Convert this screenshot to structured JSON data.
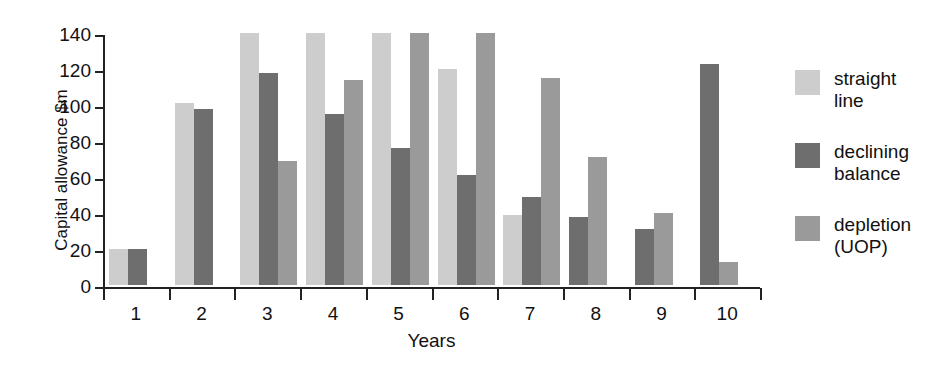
{
  "chart_data": {
    "type": "bar",
    "title": "",
    "xlabel": "Years",
    "ylabel": "Capital allowance $m",
    "categories": [
      "1",
      "2",
      "3",
      "4",
      "5",
      "6",
      "7",
      "8",
      "9",
      "10"
    ],
    "ylim": [
      0,
      140
    ],
    "yticks": [
      0,
      20,
      40,
      60,
      80,
      100,
      120,
      140
    ],
    "ytick_labels": [
      "0",
      "20",
      "40",
      "60",
      "80",
      "100",
      "120",
      "140"
    ],
    "grid": false,
    "legend_position": "right",
    "series": [
      {
        "name": "straight\nline",
        "color": "#cdcdcd",
        "values": [
          20,
          101,
          141,
          141,
          141,
          120,
          39,
          null,
          null,
          null
        ]
      },
      {
        "name": "declining\nbalance",
        "color": "#6e6e6e",
        "values": [
          20,
          98,
          118,
          95,
          76,
          61,
          49,
          38,
          31,
          123
        ]
      },
      {
        "name": "depletion\n(UOP)",
        "color": "#9a9a9a",
        "values": [
          null,
          null,
          69,
          114,
          140,
          141,
          115,
          71,
          40,
          13
        ]
      }
    ]
  },
  "colors": {
    "straight_line": "#cdcdcd",
    "declining_balance": "#6e6e6e",
    "depletion_uop": "#9a9a9a",
    "axis": "#222222",
    "text": "#111111",
    "background": "#ffffff"
  }
}
